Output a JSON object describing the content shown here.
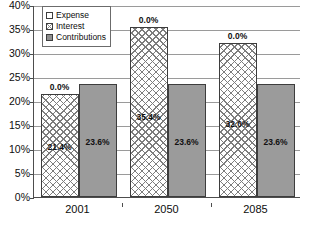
{
  "chart_data": {
    "type": "bar",
    "title": "",
    "subtitle": "",
    "xlabel": "",
    "ylabel": "",
    "categories": [
      "2001",
      "2050",
      "2085"
    ],
    "series": [
      {
        "name": "Expense",
        "values": [
          0.0,
          0.0,
          0.0
        ],
        "labels": [
          "0.0%",
          "0.0%",
          "0.0%"
        ],
        "swatch": "sw-white",
        "style": "empty"
      },
      {
        "name": "Interest",
        "values": [
          21.4,
          35.4,
          32.0
        ],
        "labels": [
          "21.4%",
          "35.4%",
          "32.0%"
        ],
        "swatch": "sw-hatch",
        "style": "hatch"
      },
      {
        "name": "Contributions",
        "values": [
          23.6,
          23.6,
          23.6
        ],
        "labels": [
          "23.6%",
          "23.6%",
          "23.6%"
        ],
        "swatch": "sw-solid",
        "style": "solid"
      }
    ],
    "ylim": [
      0,
      40
    ],
    "ytick_step": 5,
    "ytick_labels": [
      "0%",
      "5%",
      "10%",
      "15%",
      "20%",
      "25%",
      "30%",
      "35%",
      "40%"
    ],
    "ytick_values": [
      0,
      5,
      10,
      15,
      20,
      25,
      30,
      35,
      40
    ],
    "grid": true,
    "grid_axis": "y",
    "legend_position": "top-left",
    "value_label_suffix": "%",
    "colors": {
      "solid_fill": "#9b9b9b",
      "hatch_fill": "#ffffff",
      "hatch_line": "#7d7d7d",
      "bar_border": "#3d3d3d",
      "gridline": "#9a9a9a",
      "axis": "#4d4d4d",
      "text": "#0d0d0d",
      "background": "#ffffff"
    }
  },
  "legend": {
    "items": [
      {
        "label": "Expense"
      },
      {
        "label": "Interest"
      },
      {
        "label": "Contributions"
      }
    ]
  }
}
